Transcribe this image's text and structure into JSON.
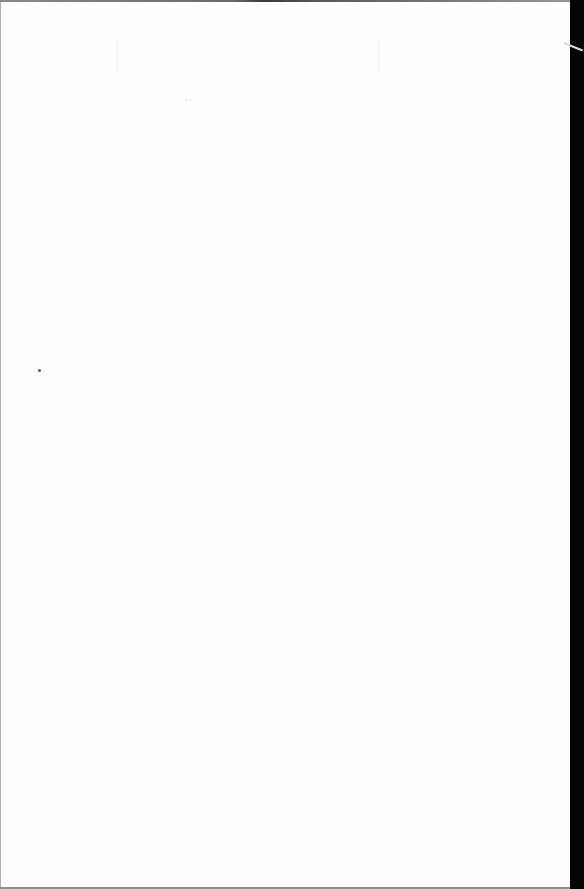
{
  "document": {
    "type": "scanned-page",
    "content": "",
    "colors": {
      "page": "#fefefe",
      "scanner_edge": "#050505",
      "border_gray": "#8e8e8e"
    },
    "specks": [
      {
        "x": 38,
        "y": 369,
        "size": 3
      },
      {
        "x": 186,
        "y": 100,
        "size": 1
      }
    ]
  }
}
